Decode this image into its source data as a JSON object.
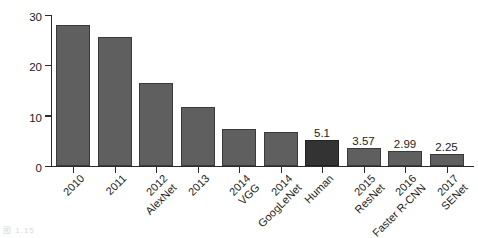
{
  "chart_data": {
    "type": "bar",
    "title": "",
    "xlabel": "",
    "ylabel": "Top 5 error rate (%)",
    "ylim": [
      0,
      30
    ],
    "yticks": [
      "0",
      "10",
      "20",
      "30"
    ],
    "grid": false,
    "legend": null,
    "categories": [
      {
        "year": "2010",
        "model": ""
      },
      {
        "year": "2011",
        "model": ""
      },
      {
        "year": "2012",
        "model": "AlexNet"
      },
      {
        "year": "2013",
        "model": ""
      },
      {
        "year": "2014",
        "model": "VGG"
      },
      {
        "year": "2014",
        "model": "GoogLeNet"
      },
      {
        "year": "Human",
        "model": ""
      },
      {
        "year": "2015",
        "model": "ResNet"
      },
      {
        "year": "2016",
        "model": "Faster R-CNN"
      },
      {
        "year": "2017",
        "model": "SENet"
      }
    ],
    "values": [
      28.1,
      25.7,
      16.4,
      11.7,
      7.4,
      6.7,
      5.1,
      3.57,
      2.99,
      2.25
    ],
    "value_labels": [
      "",
      "",
      "",
      "",
      "",
      "",
      "5.1",
      "3.57",
      "2.99",
      "2.25"
    ],
    "highlighted_index": 6,
    "bar_color": "#5f5f5f",
    "highlight_color": "#333333",
    "axis_color": "#2b2b2b"
  },
  "caption": {
    "remnant": "图 1.15"
  }
}
